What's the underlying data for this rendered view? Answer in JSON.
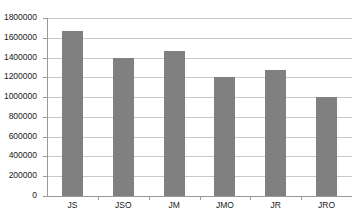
{
  "chart_data": {
    "type": "bar",
    "title": "",
    "subtitle": "",
    "xlabel": "",
    "ylabel": "",
    "categories": [
      "JS",
      "JSO",
      "JM",
      "JMO",
      "JR",
      "JRO"
    ],
    "values": [
      1670000,
      1400000,
      1470000,
      1200000,
      1270000,
      1000000
    ],
    "ylim": [
      0,
      1800000
    ],
    "ytick_step": 200000,
    "ytick_labels": [
      "0",
      "200000",
      "400000",
      "600000",
      "800000",
      "1000000",
      "1200000",
      "1400000",
      "1600000",
      "1800000"
    ],
    "grid": true,
    "legend": false,
    "legend_position": "none",
    "bar_color": "#808080",
    "gridline_color": "#c9c9c9",
    "axis_color": "#9a9a9a",
    "background_color": "#ffffff"
  }
}
